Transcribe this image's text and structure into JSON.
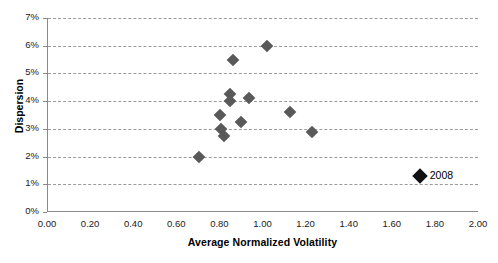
{
  "chart_data": {
    "type": "scatter",
    "title": "",
    "xlabel": "Average Normalized Volatility",
    "ylabel": "Dispersion",
    "xlim": [
      0.0,
      2.0
    ],
    "ylim": [
      0.0,
      7.0
    ],
    "xticks": [
      "0.00",
      "0.20",
      "0.40",
      "0.60",
      "0.80",
      "1.00",
      "1.20",
      "1.40",
      "1.60",
      "1.80",
      "2.00"
    ],
    "xtick_values": [
      0.0,
      0.2,
      0.4,
      0.6,
      0.8,
      1.0,
      1.2,
      1.4,
      1.6,
      1.8,
      2.0
    ],
    "yticks": [
      "0%",
      "1%",
      "2%",
      "3%",
      "4%",
      "5%",
      "6%",
      "7%"
    ],
    "ytick_values": [
      0,
      1,
      2,
      3,
      4,
      5,
      6,
      7
    ],
    "grid": "horizontal-dashed",
    "legend": "none",
    "marker": "diamond",
    "marker_color": "#595959",
    "highlight_color": "#111111",
    "gridline_color": "#9b9b9b",
    "axis_color": "#8a8a8a",
    "series": [
      {
        "name": "years",
        "points": [
          {
            "x": 0.7,
            "y": 2.0
          },
          {
            "x": 0.8,
            "y": 3.5
          },
          {
            "x": 0.805,
            "y": 3.0
          },
          {
            "x": 0.815,
            "y": 2.75
          },
          {
            "x": 0.845,
            "y": 4.25
          },
          {
            "x": 0.845,
            "y": 4.0
          },
          {
            "x": 0.86,
            "y": 5.5
          },
          {
            "x": 0.895,
            "y": 3.25
          },
          {
            "x": 1.015,
            "y": 6.0
          },
          {
            "x": 0.935,
            "y": 4.1
          },
          {
            "x": 1.125,
            "y": 3.6
          },
          {
            "x": 1.225,
            "y": 2.9
          }
        ]
      },
      {
        "name": "2008",
        "highlight": true,
        "points": [
          {
            "x": 1.725,
            "y": 1.3,
            "label": "2008"
          }
        ]
      }
    ]
  }
}
